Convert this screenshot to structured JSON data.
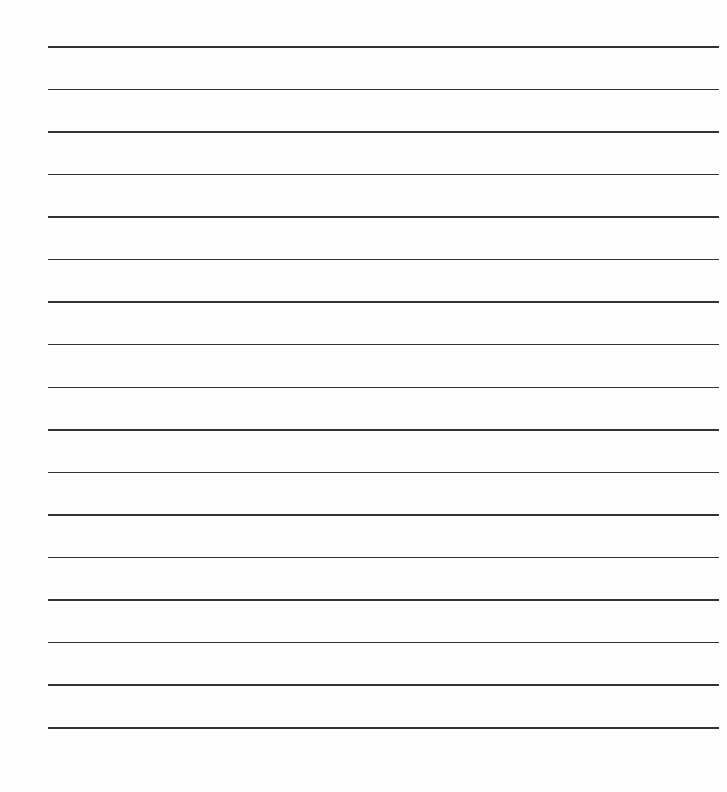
{
  "document": {
    "type": "lined-paper",
    "line_count": 17,
    "line_color": "#333333",
    "background_color": "#fefefe",
    "first_line_y": 46,
    "last_line_y": 727,
    "line_left_x": 48,
    "line_right_x": 719
  }
}
